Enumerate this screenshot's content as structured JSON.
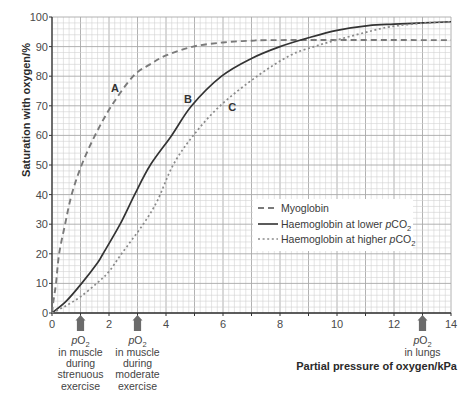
{
  "chart_data": {
    "type": "line",
    "title": "",
    "xlabel": "Partial pressure of oxygen/kPa",
    "ylabel": "Saturation with oxygen/%",
    "xlim": [
      0,
      14
    ],
    "ylim": [
      0,
      100
    ],
    "xticks": [
      0,
      2,
      4,
      6,
      8,
      10,
      12,
      14
    ],
    "yticks": [
      0,
      10,
      20,
      30,
      40,
      50,
      60,
      70,
      80,
      90,
      100
    ],
    "grid": {
      "on": true,
      "x_minor": 0.2,
      "x_major": 1,
      "y_minor": 2,
      "y_major": 10,
      "minor_color": "#d2d2d2",
      "major_color": "#a9a9a9"
    },
    "legend_position": "inside, lower right",
    "series": [
      {
        "name": "Myoglobin",
        "curve_label": "A",
        "line_style": "dashed",
        "color": "#7a7a7a",
        "points": [
          [
            0,
            0
          ],
          [
            0.05,
            4
          ],
          [
            0.14,
            10
          ],
          [
            0.25,
            20
          ],
          [
            0.46,
            30
          ],
          [
            0.69,
            40
          ],
          [
            1.04,
            50
          ],
          [
            1.51,
            60
          ],
          [
            2.09,
            70
          ],
          [
            2.85,
            80
          ],
          [
            3.44,
            84
          ],
          [
            4,
            87
          ],
          [
            4.95,
            90
          ],
          [
            6,
            91.4
          ],
          [
            7,
            92
          ],
          [
            8,
            92.2
          ],
          [
            14,
            92.2
          ]
        ]
      },
      {
        "name": "Haemoglobin at lower pCO2",
        "curve_label": "B",
        "line_style": "solid",
        "color": "#333333",
        "points": [
          [
            0,
            0
          ],
          [
            0.5,
            4
          ],
          [
            1.04,
            10
          ],
          [
            1.6,
            17
          ],
          [
            1.79,
            20
          ],
          [
            2.39,
            30
          ],
          [
            2.9,
            40
          ],
          [
            3.45,
            50
          ],
          [
            4.2,
            60
          ],
          [
            4.9,
            70
          ],
          [
            5.95,
            80
          ],
          [
            7,
            86
          ],
          [
            8,
            90
          ],
          [
            9,
            93
          ],
          [
            10,
            95.5
          ],
          [
            11.1,
            97.1
          ],
          [
            12,
            97.6
          ],
          [
            13,
            98
          ],
          [
            14,
            98.4
          ]
        ]
      },
      {
        "name": "Haemoglobin at higher pCO2",
        "curve_label": "C",
        "line_style": "dotted",
        "color": "#8a8a8a",
        "points": [
          [
            0,
            0
          ],
          [
            0.5,
            2.5
          ],
          [
            1,
            5.5
          ],
          [
            1.57,
            10
          ],
          [
            2,
            14
          ],
          [
            2.44,
            20
          ],
          [
            3.2,
            30
          ],
          [
            3.7,
            38
          ],
          [
            4.25,
            50
          ],
          [
            4.96,
            60
          ],
          [
            5.9,
            70
          ],
          [
            7.2,
            80
          ],
          [
            8.35,
            87
          ],
          [
            9.2,
            90
          ],
          [
            9.9,
            92
          ],
          [
            11,
            94.8
          ],
          [
            11.86,
            96.7
          ],
          [
            13,
            97.9
          ],
          [
            14,
            98.4
          ]
        ]
      }
    ],
    "annotations": [
      {
        "text": "A",
        "x": 2.21,
        "y": 76
      },
      {
        "text": "B",
        "x": 4.77,
        "y": 72.3
      },
      {
        "text": "C",
        "x": 6.32,
        "y": 69.6
      }
    ],
    "arrows": [
      {
        "x": 1,
        "label": "pO2 in muscle during strenuous exercise",
        "lines": [
          "in muscle",
          "during",
          "strenuous",
          "exercise"
        ]
      },
      {
        "x": 3,
        "label": "pO2 in muscle during moderate exercise",
        "lines": [
          "in muscle",
          "during",
          "moderate",
          "exercise"
        ]
      },
      {
        "x": 13,
        "label": "pO2 in lungs",
        "lines": [
          "in lungs"
        ]
      }
    ],
    "arrow_symbol": {
      "italic": "p",
      "main": "O",
      "sub": "2"
    },
    "arrow_color": "#6b6b6b"
  },
  "legend": {
    "items": [
      {
        "style": "dashed",
        "prefix": "Myoglobin",
        "var": "",
        "formula": "",
        "sub": ""
      },
      {
        "style": "solid",
        "prefix": "Haemoglobin at lower ",
        "var": "p",
        "formula": "CO",
        "sub": "2"
      },
      {
        "style": "dotted",
        "prefix": "Haemoglobin at higher ",
        "var": "p",
        "formula": "CO",
        "sub": "2"
      }
    ]
  }
}
